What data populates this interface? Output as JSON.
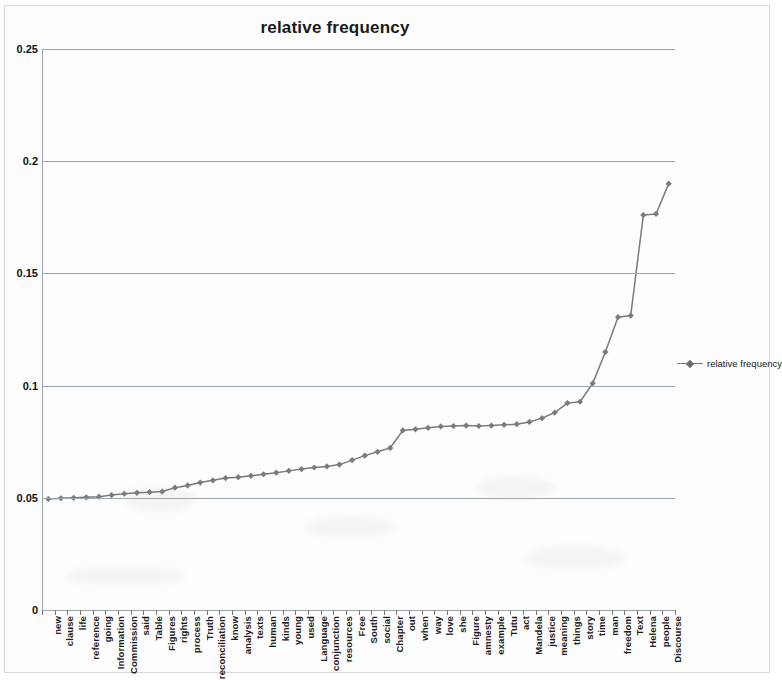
{
  "chart_data": {
    "type": "line",
    "title": "relative frequency",
    "xlabel": "",
    "ylabel": "",
    "ylim": [
      0,
      0.25
    ],
    "ytick_labels": [
      "0.25",
      "0.2",
      "0.15",
      "0.1",
      "0.05",
      "0"
    ],
    "yticks": [
      0.25,
      0.2,
      0.15,
      0.1,
      0.05,
      0
    ],
    "grid": "horizontal",
    "legend_position": "right",
    "legend": [
      "relative frequency"
    ],
    "marker": "diamond",
    "series_color": "#7b7b7b",
    "categories": [
      "new",
      "clause",
      "life",
      "reference",
      "going",
      "Information",
      "Commission",
      "said",
      "Table",
      "Figures",
      "rights",
      "process",
      "Truth",
      "reconciliation",
      "know",
      "analysis",
      "texts",
      "human",
      "kinds",
      "young",
      "used",
      "Language",
      "conjunction",
      "resources",
      "Free",
      "South",
      "social",
      "Chapter",
      "out",
      "when",
      "way",
      "love",
      "she",
      "Figure",
      "amnesty",
      "example",
      "Tutu",
      "act",
      "Mandela",
      "justice",
      "meaning",
      "things",
      "story",
      "time",
      "man",
      "freedom",
      "Text",
      "Helena",
      "people",
      "Discourse"
    ],
    "series": [
      {
        "name": "relative frequency",
        "values": [
          0.0495,
          0.0498,
          0.05,
          0.0502,
          0.0505,
          0.0512,
          0.0518,
          0.0522,
          0.0525,
          0.0528,
          0.0545,
          0.0555,
          0.0568,
          0.0578,
          0.0588,
          0.0592,
          0.0598,
          0.0605,
          0.0612,
          0.062,
          0.0628,
          0.0635,
          0.064,
          0.0648,
          0.0668,
          0.0688,
          0.0705,
          0.0722,
          0.08,
          0.0805,
          0.0812,
          0.0818,
          0.082,
          0.0822,
          0.082,
          0.0822,
          0.0825,
          0.0828,
          0.0838,
          0.0855,
          0.088,
          0.0922,
          0.0928,
          0.101,
          0.115,
          0.1305,
          0.1312,
          0.176,
          0.1765,
          0.19
        ]
      }
    ]
  }
}
